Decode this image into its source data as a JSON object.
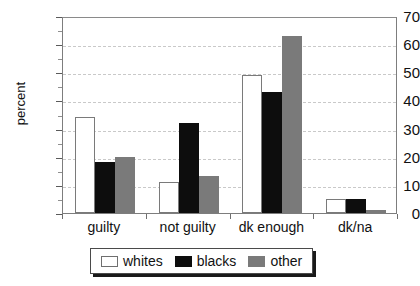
{
  "chart_data": {
    "type": "bar",
    "title": "",
    "xlabel": "",
    "ylabel": "percent",
    "categories": [
      "guilty",
      "not guilty",
      "dk enough",
      "dk/na"
    ],
    "series": [
      {
        "name": "whites",
        "color": "#ffffff",
        "values": [
          34,
          11,
          49,
          5
        ]
      },
      {
        "name": "blacks",
        "color": "#0d0d0d",
        "values": [
          18,
          32,
          43,
          5
        ]
      },
      {
        "name": "other",
        "color": "#7a7a7a",
        "values": [
          20,
          13,
          63,
          1
        ]
      }
    ],
    "ylim": [
      0,
      70
    ],
    "yticks": [
      0,
      10,
      20,
      30,
      40,
      50,
      60,
      70
    ],
    "ytick_labels": [
      "0",
      "10",
      "20",
      "30",
      "40",
      "50",
      "60",
      "70"
    ],
    "y_minor_tick_step": 5,
    "grid": "horizontal-dashed",
    "legend_position": "below-center",
    "legend_entries": [
      "whites",
      "blacks",
      "other"
    ]
  },
  "axes": {
    "y_title": "percent"
  }
}
